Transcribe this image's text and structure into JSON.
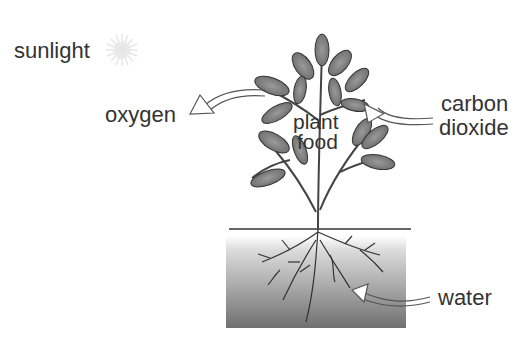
{
  "diagram": {
    "type": "photosynthesis",
    "labels": {
      "sunlight": "sunlight",
      "oxygen": "oxygen",
      "carbon_dioxide_line1": "carbon",
      "carbon_dioxide_line2": "dioxide",
      "plant_food_line1": "plant",
      "plant_food_line2": "food",
      "water": "water"
    },
    "arrows": [
      {
        "name": "oxygen-arrow",
        "direction": "out of leaves to the left"
      },
      {
        "name": "carbon-dioxide-arrow",
        "direction": "into leaves from the right"
      },
      {
        "name": "water-arrow",
        "direction": "into roots from the right"
      }
    ],
    "colors": {
      "text": "#333333",
      "leaf_fill": "#8a8a8a",
      "stem": "#444444",
      "soil_top": "#e6e6e6",
      "soil_bottom": "#777777",
      "sun": "#e8e8e8"
    }
  }
}
